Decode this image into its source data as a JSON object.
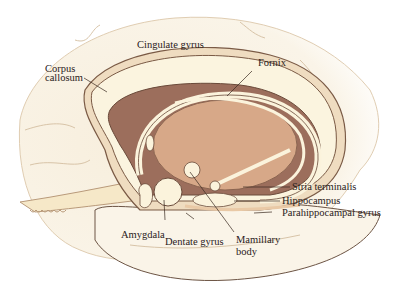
{
  "diagram": {
    "labels": {
      "cingulate_gyrus": "Cingulate gyrus",
      "corpus_callosum_1": "Corpus",
      "corpus_callosum_2": "callosum",
      "fornix": "Fornix",
      "stria_terminalis": "Stria terminalis",
      "hippocampus": "Hippocampus",
      "parahippocampal_gyrus": "Parahippocampal gyrus",
      "amygdala": "Amygdala",
      "dentate_gyrus": "Dentate gyrus",
      "mamillary_body_1": "Mamillary",
      "mamillary_body_2": "body"
    },
    "colors": {
      "background": "#ffffff",
      "brain_fill": "#faf3e4",
      "outline": "#d8c4a8",
      "white_matter": "#fbf3dc",
      "dark_region": "#9c6e5c",
      "thalamus": "#d7a888",
      "cortex_band": "#e9c9a6",
      "line": "#5a4032"
    }
  }
}
